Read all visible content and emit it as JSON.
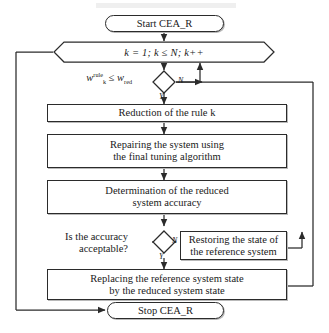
{
  "diagram": {
    "type": "flowchart",
    "nodes": [
      {
        "id": "start",
        "shape": "terminator",
        "label": "Start CEA_R"
      },
      {
        "id": "loop",
        "shape": "hexagon",
        "label": "k = 1; k ≤ N; k++"
      },
      {
        "id": "cond1",
        "shape": "decision",
        "label": "",
        "side_label_line1": "w",
        "side_label_sup": "rule",
        "side_label_sub": "k",
        "side_label_op": "≤",
        "side_label_w2": "w",
        "side_label_w2sub": "red",
        "yes": "Y",
        "no": "N"
      },
      {
        "id": "reduction",
        "shape": "process",
        "line1": "Reduction of the rule k"
      },
      {
        "id": "repair",
        "shape": "process",
        "line1": "Repairing the system using",
        "line2": "the final tuning algorithm"
      },
      {
        "id": "determine",
        "shape": "process",
        "line1": "Determination of the reduced",
        "line2": "system accuracy"
      },
      {
        "id": "cond2",
        "shape": "decision",
        "line1": "Is the accuracy",
        "line2": "acceptable?",
        "yes": "Y",
        "no": "N"
      },
      {
        "id": "restore",
        "shape": "process",
        "line1": "Restoring the state of",
        "line2": "the reference system"
      },
      {
        "id": "replace",
        "shape": "process",
        "line1": "Replacing the reference system state",
        "line2": "by the reduced system state"
      },
      {
        "id": "stop",
        "shape": "terminator",
        "label": "Stop CEA_R"
      }
    ],
    "branch_labels": {
      "yes": "Y",
      "no": "N"
    },
    "colors": {
      "stroke": "#2b2b2b",
      "fill": "#ffffff",
      "shadow": "#b9b9b9",
      "text": "#1a1a1a"
    }
  }
}
